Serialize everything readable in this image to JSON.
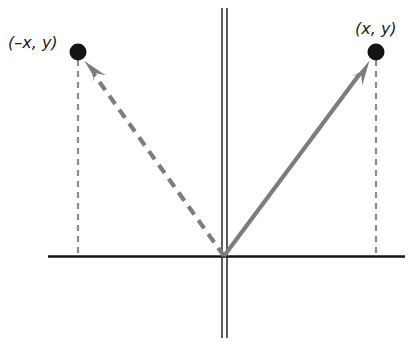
{
  "figure": {
    "title": "",
    "type": "coordinate-plane-diagram",
    "background_color": "#ffffff",
    "axis_color": "#161616",
    "vector_color": "#7a7a7a",
    "point_color": "#141414",
    "label_color": "#1a1a1a",
    "labels": {
      "left_point": "(–x, y)",
      "right_point": "(x, y)"
    },
    "axes": {
      "origin": {
        "x": 224,
        "y": 256
      },
      "x_axis": {
        "x_start": 48,
        "x_end": 405,
        "y": 256,
        "style": "solid",
        "width": 2.6
      },
      "y_axis": {
        "x_left_line": 222,
        "x_right_line": 227,
        "y_start": 8,
        "y_end": 338,
        "style": "double-line",
        "width": 1.4
      }
    },
    "points": [
      {
        "name": "left-point",
        "label": "(–x, y)",
        "x": 78,
        "y": 52,
        "radius": 8.5
      },
      {
        "name": "right-point",
        "label": "(x, y)",
        "x": 376,
        "y": 52,
        "radius": 8.5
      }
    ],
    "vectors": [
      {
        "name": "reflected-vector",
        "from_x": 224,
        "from_y": 256,
        "to_x": 78,
        "to_y": 52,
        "style": "dashed",
        "color": "#7d7d7d",
        "arrowhead": true
      },
      {
        "name": "original-vector",
        "from_x": 224,
        "from_y": 256,
        "to_x": 376,
        "to_y": 52,
        "style": "solid",
        "color": "#7d7d7d",
        "arrowhead": true
      }
    ],
    "drop_lines": [
      {
        "name": "left-drop-line",
        "x": 78,
        "y_start": 60,
        "y_end": 256,
        "style": "dashed",
        "color": "#8c8c8c"
      },
      {
        "name": "right-drop-line",
        "x": 376,
        "y_start": 60,
        "y_end": 256,
        "style": "dashed",
        "color": "#8c8c8c"
      }
    ]
  }
}
